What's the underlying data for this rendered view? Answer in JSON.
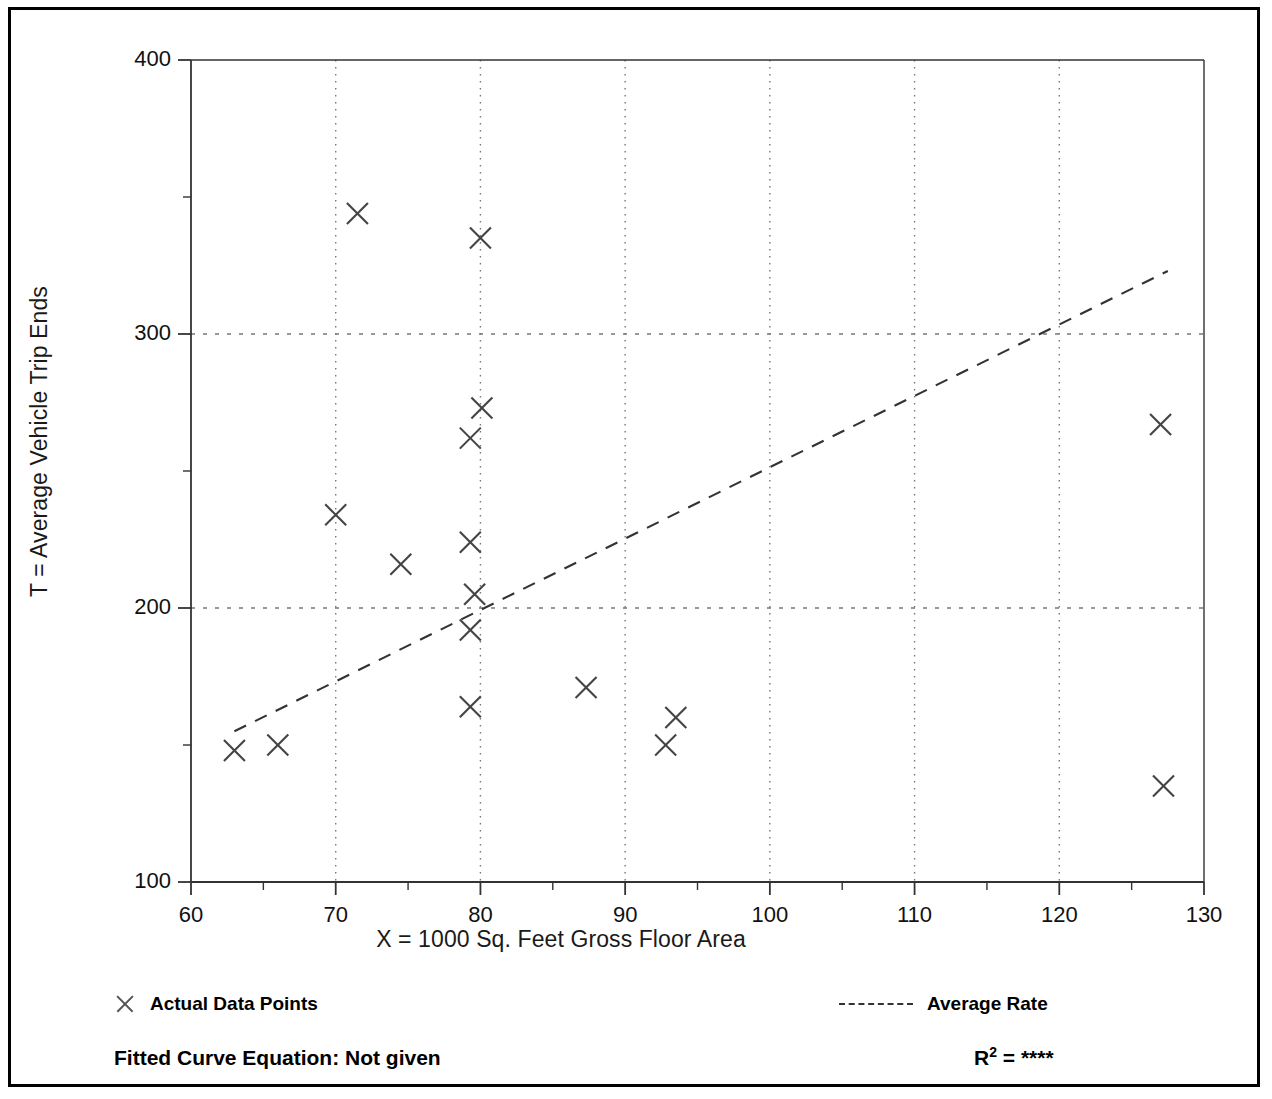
{
  "figure": {
    "frame_color": "#000000",
    "background_color": "#ffffff"
  },
  "legend": {
    "data_points_label": "Actual Data Points",
    "average_rate_label": "Average Rate",
    "marker_icon": "x-marker-icon",
    "line_icon": "dashed-line-icon"
  },
  "captions": {
    "fitted_equation": "Fitted Curve Equation:  Not given",
    "r_squared_symbol": "R",
    "r_squared_exponent": "2",
    "r_squared_value": "= ****"
  },
  "chart_data": {
    "type": "scatter",
    "title": "",
    "xlabel": "X = 1000 Sq. Feet Gross Floor Area",
    "ylabel": "T = Average Vehicle Trip Ends",
    "xlim": [
      60,
      130
    ],
    "ylim": [
      100,
      400
    ],
    "xticks": [
      60,
      70,
      80,
      90,
      100,
      110,
      120,
      130
    ],
    "yticks": [
      100,
      200,
      300,
      400
    ],
    "xtick_labels": [
      "60",
      "70",
      "80",
      "90",
      "100",
      "110",
      "120",
      "130"
    ],
    "ytick_labels": [
      "100",
      "200",
      "300",
      "400"
    ],
    "x_minor_step": 5,
    "y_minor_step": 50,
    "grid": true,
    "grid_style": "dotted",
    "grid_x_values": [
      70,
      80,
      90,
      100,
      110,
      120
    ],
    "grid_y_values": [
      200,
      300
    ],
    "legend_position": "below-plot",
    "marker": "x",
    "marker_color": "#444444",
    "series": [
      {
        "name": "Actual Data Points",
        "type": "scatter",
        "points": [
          [
            63.0,
            148
          ],
          [
            66.0,
            150
          ],
          [
            70.0,
            234
          ],
          [
            71.5,
            344
          ],
          [
            74.5,
            216
          ],
          [
            79.3,
            262
          ],
          [
            79.3,
            224
          ],
          [
            79.3,
            192
          ],
          [
            79.3,
            164
          ],
          [
            79.6,
            205
          ],
          [
            80.0,
            335
          ],
          [
            80.1,
            273
          ],
          [
            87.3,
            171
          ],
          [
            92.8,
            150
          ],
          [
            93.5,
            160
          ],
          [
            127.0,
            267
          ],
          [
            127.2,
            135
          ]
        ]
      },
      {
        "name": "Average Rate",
        "type": "line",
        "style": "dashed",
        "color": "#333333",
        "endpoints": [
          [
            63.0,
            155
          ],
          [
            127.5,
            323
          ]
        ]
      }
    ]
  }
}
